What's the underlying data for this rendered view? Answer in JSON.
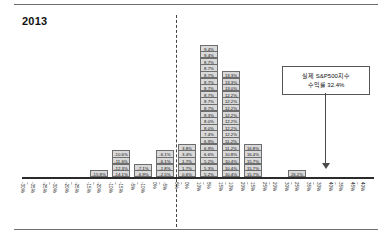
{
  "title": "2013",
  "callout": {
    "line1": "실제 S&P500지수",
    "line2": "수익률 32.4%"
  },
  "chart_data": {
    "type": "bar",
    "title": "2013",
    "xlabel": "",
    "ylabel": "",
    "grid": false,
    "legend": "none",
    "zero_line_after_category": "0% ~ 5% (left edge)",
    "categories": [
      "-35% ~ -30%",
      "-30% ~ -25%",
      "-25% ~ -20%",
      "-20% ~ -15%",
      "-15% ~ -10%",
      "-10% ~ -5%",
      "-5% ~ 0%",
      "0% ~ 5%",
      "5% ~ 10%",
      "10% ~ 15%",
      "15% ~ 20%",
      "20% ~ 25%",
      "25% ~ 30%",
      "30% ~ 35%",
      "35% ~ 40%",
      "40% ~ 45%"
    ],
    "counts": [
      0,
      0,
      0,
      1,
      4,
      2,
      4,
      5,
      20,
      16,
      5,
      0,
      1,
      0,
      0,
      0
    ],
    "stacks": [
      [],
      [],
      [],
      [
        "-15.8%"
      ],
      [
        "-14.1%",
        "-12.3%",
        "-11.6%",
        "-10.6%"
      ],
      [
        "-6.9%",
        "-7.1%"
      ],
      [
        "-2.5%",
        "-1.8%",
        "-6.1%",
        "-6.1%"
      ],
      [
        "0.6%",
        "1.7%",
        "1.7%",
        "3.4%",
        "3.8%"
      ],
      [
        "5.2%",
        "5.3%",
        "5.2%",
        "6.6%",
        "6.9%",
        "6.9%",
        "7.4%",
        "8.0%",
        "8.0%",
        "8.3%",
        "8.7%",
        "8.7%",
        "8.7%",
        "8.7%",
        "8.7%",
        "8.7%",
        "8.7%",
        "8.7%",
        "9.4%",
        "9.4%"
      ],
      [
        "10.4%",
        "10.4%",
        "10.4%",
        "10.8%",
        "11.2%",
        "11.2%",
        "12.2%",
        "12.2%",
        "12.2%",
        "12.2%",
        "12.2%",
        "12.2%",
        "12.2%",
        "13.0%",
        "13.3%",
        "13.3%"
      ],
      [
        "15.7%",
        "15.7%",
        "15.7%",
        "16.4%",
        "16.8%"
      ],
      [],
      [
        "26.2%"
      ],
      [],
      []
    ],
    "annotation": {
      "text": "실제 S&P500지수 수익률 32.4%",
      "value": 32.4,
      "points_to_category": "30% ~ 35%"
    }
  }
}
